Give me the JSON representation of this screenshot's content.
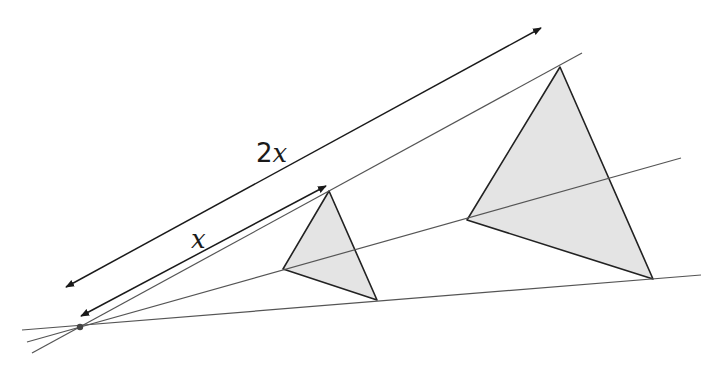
{
  "diagram": {
    "type": "enlargement",
    "colors": {
      "background": "#ffffff",
      "ray": "#555555",
      "arrow": "#1a1a1a",
      "triangle_edge": "#222222",
      "triangle_fill": "#e4e4e4",
      "center_point": "#444444"
    },
    "center": {
      "x": 80,
      "y": 327
    },
    "rays": [
      {
        "name": "upper",
        "from": [
          32,
          353
        ],
        "to": [
          582,
          53
        ]
      },
      {
        "name": "middle",
        "from": [
          27,
          342
        ],
        "to": [
          681,
          158
        ]
      },
      {
        "name": "lower",
        "from": [
          22,
          330
        ],
        "to": [
          701,
          275
        ]
      }
    ],
    "triangles": [
      {
        "name": "object",
        "vertices": [
          [
            329,
            191
          ],
          [
            283,
            269
          ],
          [
            377,
            300
          ]
        ]
      },
      {
        "name": "image",
        "vertices": [
          [
            560,
            67
          ],
          [
            467,
            220
          ],
          [
            653,
            279
          ]
        ]
      }
    ],
    "dimension_arrows": [
      {
        "name": "2x",
        "from": [
          66,
          287
        ],
        "to": [
          541,
          28
        ]
      },
      {
        "name": "x",
        "from": [
          81,
          316
        ],
        "to": [
          326,
          186
        ]
      }
    ],
    "labels": {
      "two_x": {
        "number": "2",
        "variable": "x",
        "x": 256,
        "y": 140
      },
      "x": {
        "variable": "x",
        "x": 191,
        "y": 226
      }
    }
  }
}
